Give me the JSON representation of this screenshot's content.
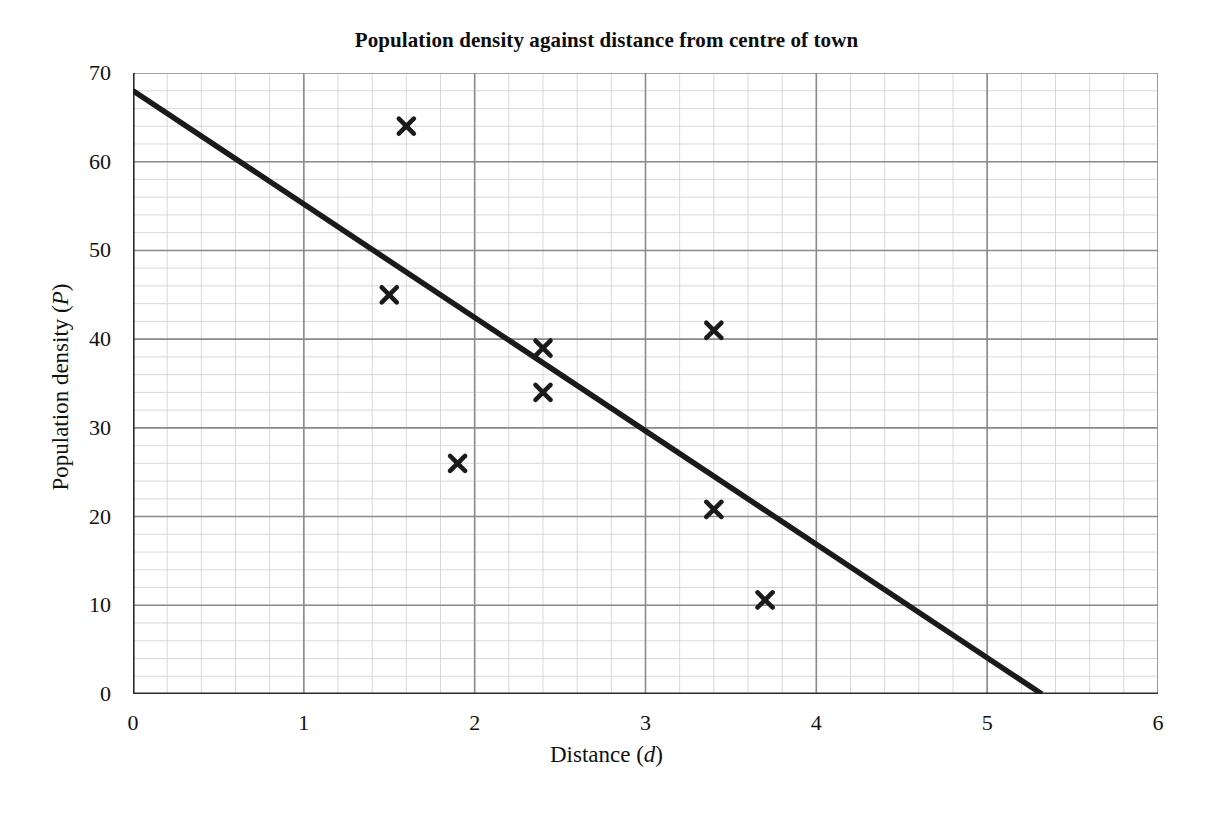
{
  "chart_data": {
    "type": "scatter",
    "title": "Population density against distance from centre of town",
    "subtitle": "",
    "xlabel": "Distance (d)",
    "xlabel_text": "Distance (",
    "xlabel_var": "d",
    "xlabel_close": ")",
    "ylabel": "Population density (P)",
    "ylabel_text": "Population density (",
    "ylabel_var": "P",
    "ylabel_close": ")",
    "xlim": [
      0,
      6
    ],
    "ylim": [
      0,
      70
    ],
    "xticks": [
      0,
      1,
      2,
      3,
      4,
      5,
      6
    ],
    "yticks": [
      0,
      10,
      20,
      30,
      40,
      50,
      60,
      70
    ],
    "xtick_labels": [
      "0",
      "1",
      "2",
      "3",
      "4",
      "5",
      "6"
    ],
    "ytick_labels": [
      "0",
      "10",
      "20",
      "30",
      "40",
      "50",
      "60",
      "70"
    ],
    "grid": true,
    "grid_major_step_x": 1,
    "grid_major_step_y": 10,
    "grid_minor_step_x": 0.2,
    "grid_minor_step_y": 2,
    "legend": false,
    "legend_position": "none",
    "marker": "x-cross",
    "marker_color": "#1a1a1a",
    "points": [
      {
        "d": 1.5,
        "P": 45
      },
      {
        "d": 1.6,
        "P": 64
      },
      {
        "d": 1.9,
        "P": 26
      },
      {
        "d": 2.4,
        "P": 39
      },
      {
        "d": 2.4,
        "P": 34
      },
      {
        "d": 3.4,
        "P": 41
      },
      {
        "d": 3.4,
        "P": 20.8
      },
      {
        "d": 3.7,
        "P": 10.6
      }
    ],
    "series": [
      {
        "name": "Data points",
        "type": "scatter",
        "x": [
          1.5,
          1.6,
          1.9,
          2.4,
          2.4,
          3.4,
          3.4,
          3.7
        ],
        "values": [
          45,
          64,
          26,
          39,
          34,
          41,
          20.8,
          10.6
        ]
      },
      {
        "name": "Line of best fit",
        "type": "line",
        "x": [
          0,
          5.32
        ],
        "values": [
          68,
          0
        ],
        "color": "#1a1a1a",
        "width": 5
      }
    ],
    "trend_line": {
      "label": "Line of best fit",
      "start": {
        "d": 0,
        "P": 68
      },
      "end": {
        "d": 5.32,
        "P": 0
      },
      "color": "#1a1a1a"
    },
    "colors": {
      "axis": "#2b2b2b",
      "grid_major": "#8a8a8a",
      "grid_minor": "#cfcfcf",
      "marker": "#1a1a1a",
      "line": "#1a1a1a",
      "background": "#ffffff"
    }
  }
}
